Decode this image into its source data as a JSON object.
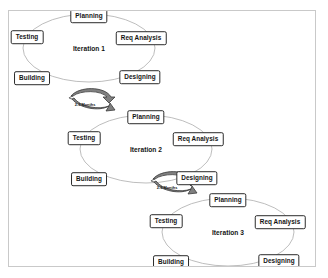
{
  "diagram": {
    "background_color": "#ffffff",
    "frame_border_color": "#c9c9c9",
    "ellipse_stroke_color": "#b5b5b5",
    "box_border_color": "#2b2b2b",
    "arrow_fill_color": "#808080",
    "arrow_stroke_color": "#3a3a3a",
    "cycles": [
      {
        "name": "iteration-1",
        "label": "Iteration 1",
        "center": {
          "x": 80,
          "y": 37
        },
        "radius": {
          "x": 66,
          "y": 34
        },
        "phases": [
          {
            "name": "planning",
            "label": "Planning",
            "x": 80,
            "y": 5
          },
          {
            "name": "req-analysis",
            "label": "Req Analysis",
            "x": 132,
            "y": 27
          },
          {
            "name": "designing",
            "label": "Designing",
            "x": 131,
            "y": 66
          },
          {
            "name": "building",
            "label": "Building",
            "x": 23,
            "y": 67
          },
          {
            "name": "testing",
            "label": "Testing",
            "x": 18,
            "y": 26
          }
        ]
      },
      {
        "name": "iteration-2",
        "label": "Iteration 2",
        "center": {
          "x": 137,
          "y": 138
        },
        "radius": {
          "x": 66,
          "y": 34
        },
        "phases": [
          {
            "name": "planning",
            "label": "Planning",
            "x": 137,
            "y": 106
          },
          {
            "name": "req-analysis",
            "label": "Req Analysis",
            "x": 189,
            "y": 128
          },
          {
            "name": "designing",
            "label": "Designing",
            "x": 188,
            "y": 167
          },
          {
            "name": "building",
            "label": "Building",
            "x": 80,
            "y": 168
          },
          {
            "name": "testing",
            "label": "Testing",
            "x": 75,
            "y": 127
          }
        ]
      },
      {
        "name": "iteration-3",
        "label": "Iteration 3",
        "center": {
          "x": 219,
          "y": 221
        },
        "radius": {
          "x": 66,
          "y": 34
        },
        "phases": [
          {
            "name": "planning",
            "label": "Planning",
            "x": 219,
            "y": 189
          },
          {
            "name": "req-analysis",
            "label": "Req Analysis",
            "x": 271,
            "y": 211
          },
          {
            "name": "designing",
            "label": "Designing",
            "x": 270,
            "y": 250
          },
          {
            "name": "building",
            "label": "Building",
            "x": 162,
            "y": 251
          },
          {
            "name": "testing",
            "label": "Testing",
            "x": 157,
            "y": 210
          }
        ]
      }
    ],
    "transitions": [
      {
        "name": "transition-1-to-2",
        "label": "2-3 Months",
        "label_x": 76,
        "label_y": 93,
        "arrow_x": 62,
        "arrow_y": 82
      },
      {
        "name": "transition-2-to-3",
        "label": "2-3 Months",
        "label_x": 158,
        "label_y": 176,
        "arrow_x": 144,
        "arrow_y": 165
      }
    ]
  }
}
